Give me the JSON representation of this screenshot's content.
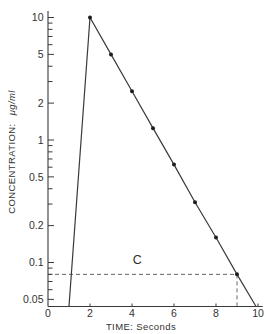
{
  "chart_data": {
    "type": "line",
    "title": "",
    "xlabel": "TIME:  Seconds",
    "ylabel": "CONCENTRATION:  μg/ml",
    "ylabel_text": "CONCENTRATION:",
    "ylabel_unit": "μg/ml",
    "xlim": [
      0,
      10.2
    ],
    "ylim": [
      0.044,
      10
    ],
    "yscale": "log",
    "grid": false,
    "legend": null,
    "xticks": [
      0,
      2,
      4,
      6,
      8,
      10
    ],
    "xtick_labels": [
      "0",
      "2",
      "4",
      "6",
      "8",
      "10"
    ],
    "yticks": [
      10,
      5,
      2,
      1,
      0.5,
      0.2,
      0.1,
      0.05
    ],
    "ytick_labels": [
      "10",
      "5",
      "2",
      "1",
      "0.5",
      "0.2",
      "0.1",
      "0.05"
    ],
    "yminor_ticks": [
      9,
      8,
      7,
      6,
      4,
      3,
      0.9,
      0.8,
      0.7,
      0.6,
      0.4,
      0.3,
      0.09,
      0.08,
      0.07,
      0.06
    ],
    "series": [
      {
        "name": "Concentration",
        "x": [
          1,
          2,
          3,
          4,
          5,
          6,
          7,
          8,
          9,
          9.9
        ],
        "y": [
          0.044,
          10,
          5,
          2.5,
          1.25,
          0.63,
          0.31,
          0.16,
          0.08,
          0.044
        ],
        "color": "#3a3a3a"
      }
    ],
    "markers": {
      "x": [
        2,
        3,
        4,
        5,
        6,
        7,
        8,
        9
      ],
      "y": [
        10,
        5,
        2.5,
        1.25,
        0.63,
        0.31,
        0.16,
        0.08
      ]
    },
    "reference_lines": [
      {
        "orientation": "horizontal",
        "y": 0.08,
        "x_from": 0,
        "x_to": 9,
        "style": "dashed"
      },
      {
        "orientation": "vertical",
        "x": 9,
        "y_from": 0.08,
        "y_to": 0.044,
        "style": "dashed"
      }
    ],
    "annotations": [
      {
        "text": "C",
        "x": 4.25,
        "y": 0.105
      }
    ]
  }
}
